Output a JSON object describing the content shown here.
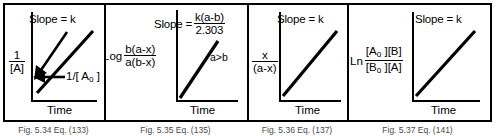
{
  "figure": {
    "panel_count": 4,
    "line_color": "#000000",
    "background_color": "#ffffff",
    "border_color": "#000000"
  },
  "panels": [
    {
      "id": "panel-1",
      "slope_label": "Slope = k",
      "y_axis": {
        "type": "fraction",
        "numerator": "1",
        "denominator": "[A]"
      },
      "x_axis_label": "Time",
      "intercept_label": "1/[ A",
      "intercept_subscript": "o",
      "intercept_label_tail": " ]",
      "has_intercept_arrow": true,
      "caption": "Fig. 5.34  Eq. (133)"
    },
    {
      "id": "panel-2",
      "slope_prefix": "Slope = ",
      "slope_fraction": {
        "numerator": "k(a-b)",
        "denominator": "2.303"
      },
      "y_axis": {
        "type": "fraction-with-prefix",
        "prefix": "Log",
        "numerator": "b(a-x)",
        "denominator": "a(b-x)"
      },
      "x_axis_label": "Time",
      "condition_note": "a>b",
      "has_intercept_arrow": false,
      "caption": "Fig. 5.35  Eq. (135)"
    },
    {
      "id": "panel-3",
      "slope_label": "Slope = k",
      "y_axis": {
        "type": "fraction",
        "numerator": "x",
        "denominator": "(a-x)"
      },
      "x_axis_label": "Time",
      "has_intercept_arrow": false,
      "caption": "Fig. 5.36  Eq. (137)"
    },
    {
      "id": "panel-4",
      "slope_label": "Slope = k",
      "y_axis": {
        "type": "fraction-with-prefix",
        "prefix": "Ln",
        "numerator_a": "[A",
        "numerator_sub": "o",
        "numerator_b": " ][B]",
        "denominator_a": "[B",
        "denominator_sub": "o",
        "denominator_b": " ][A]"
      },
      "x_axis_label": "Time",
      "has_intercept_arrow": false,
      "caption": "Fig. 5.37  Eq. (141)"
    }
  ]
}
